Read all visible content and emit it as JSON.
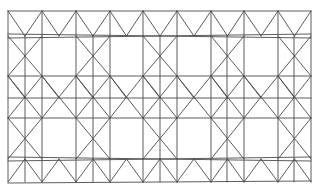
{
  "diagram": {
    "type": "lattice-truss",
    "stroke_color": "#4a4a4a",
    "stroke_width": 0.9,
    "background": "#ffffff",
    "columns_x": [
      8,
      42,
      76,
      110,
      143,
      177,
      211,
      244,
      278,
      311
    ],
    "x_column_centers": [
      25,
      93,
      160,
      227,
      294
    ],
    "rows": {
      "top": 11,
      "upper_chord": 36,
      "mid_top": 76,
      "mid_center": 98,
      "mid_bottom": 118,
      "lower_chord": 159,
      "bottom": 182
    },
    "double_chords": [
      {
        "name": "upper",
        "a": [
          [
            8,
            34
          ],
          [
            311,
            38
          ]
        ],
        "b": [
          [
            8,
            38
          ],
          [
            311,
            34
          ]
        ]
      },
      {
        "name": "lower",
        "a": [
          [
            8,
            157
          ],
          [
            311,
            161
          ]
        ],
        "b": [
          [
            8,
            161
          ],
          [
            311,
            157
          ]
        ]
      }
    ]
  }
}
